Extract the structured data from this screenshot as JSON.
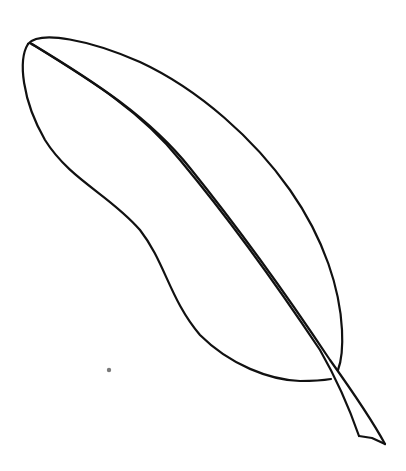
{
  "image": {
    "subject": "feather line drawing",
    "style": "hand-drawn black ink outline on white",
    "colors": {
      "background": "#ffffff",
      "ink": "#111111",
      "speck": "#7a7a7a"
    },
    "parts": [
      "vane-outline",
      "shaft",
      "quill-tip",
      "ink-speck"
    ]
  }
}
